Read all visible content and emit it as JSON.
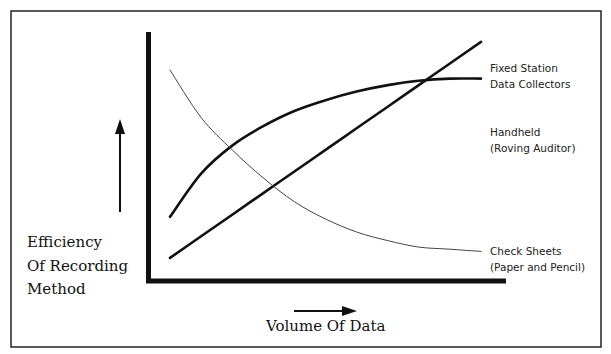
{
  "chart_data": {
    "type": "line",
    "title": "",
    "xlabel": "Volume Of Data",
    "ylabel": "Efficiency Of Recording Method",
    "ylabel_lines": [
      "Efficiency",
      "Of Recording",
      "Method"
    ],
    "grid": false,
    "legend_position": "inline-right",
    "x": [
      0,
      10,
      20,
      30,
      40,
      50,
      60,
      70,
      80,
      90,
      100
    ],
    "xlim": [
      0,
      100
    ],
    "ylim": [
      0,
      100
    ],
    "series": [
      {
        "name": "Fixed Station Data Collectors",
        "label_lines": [
          "Fixed Station",
          "Data Collectors"
        ],
        "style": "thick",
        "values": [
          7,
          17,
          27,
          37,
          47,
          57,
          67,
          77,
          87,
          97,
          107
        ]
      },
      {
        "name": "Handheld (Roving Auditor)",
        "label_lines": [
          "Handheld",
          "(Roving Auditor)"
        ],
        "style": "thick",
        "values": [
          26,
          46,
          59,
          68,
          75,
          80,
          84,
          87,
          89,
          90,
          90
        ]
      },
      {
        "name": "Check Sheets (Paper and Pencil)",
        "label_lines": [
          "Check Sheets",
          "(Paper and Pencil)"
        ],
        "style": "thin",
        "values": [
          94,
          72,
          57,
          44,
          33,
          25,
          19,
          15,
          12,
          11,
          10
        ]
      }
    ]
  }
}
